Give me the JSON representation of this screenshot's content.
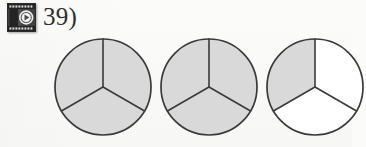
{
  "page": {
    "background_color": "#fbfbfa"
  },
  "header": {
    "icon": {
      "name": "video-play-icon",
      "film_body_color": "#3b3b3b",
      "film_edge_color": "#1d1d1d",
      "sprocket_color": "#d6d6d6",
      "play_circle_color": "#f2f2f2",
      "play_triangle_color": "#4a4a4a"
    },
    "question_number": "39)"
  },
  "colors": {
    "shaded_fill": "#d9d9d9",
    "unshaded_fill": "#ffffff",
    "stroke": "#3a3a3a",
    "text": "#2e2e2e"
  },
  "diagram": {
    "type": "fraction-circles",
    "sections_per_circle": 3,
    "total_shaded_sections": 7,
    "mixed_number": "2 1/3",
    "improper_fraction": "7/3",
    "circles": [
      {
        "label": "circle-1",
        "shaded_sections": 3,
        "sections": [
          {
            "label": "top-left-section",
            "shaded": true
          },
          {
            "label": "top-right-section",
            "shaded": true
          },
          {
            "label": "bottom-section",
            "shaded": true
          }
        ]
      },
      {
        "label": "circle-2",
        "shaded_sections": 3,
        "sections": [
          {
            "label": "top-left-section",
            "shaded": true
          },
          {
            "label": "top-right-section",
            "shaded": true
          },
          {
            "label": "bottom-section",
            "shaded": true
          }
        ]
      },
      {
        "label": "circle-3",
        "shaded_sections": 1,
        "sections": [
          {
            "label": "top-left-section",
            "shaded": true
          },
          {
            "label": "top-right-section",
            "shaded": false
          },
          {
            "label": "bottom-section",
            "shaded": false
          }
        ]
      }
    ]
  }
}
